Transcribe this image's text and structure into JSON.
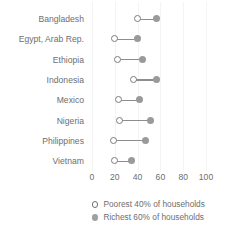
{
  "chart_data": {
    "type": "scatter",
    "subtype": "dumbbell",
    "title": "",
    "xlabel": "",
    "ylabel": "",
    "xlim": [
      0,
      100
    ],
    "xticks": [
      0,
      20,
      40,
      60,
      80,
      100
    ],
    "xtick_labels": [
      "0",
      "20",
      "40",
      "60",
      "80",
      "100"
    ],
    "grid": true,
    "legend_position": "bottom",
    "categories": [
      "Bangladesh",
      "Egypt, Arab Rep.",
      "Ethiopia",
      "Indonesia",
      "Mexico",
      "Nigeria",
      "Philippines",
      "Vietnam"
    ],
    "series": [
      {
        "name": "Poorest 40% of households",
        "marker": "open-circle",
        "color": "#7c7c7c",
        "values": [
          40,
          20,
          22,
          36,
          23,
          24,
          19,
          20
        ]
      },
      {
        "name": "Richest 60% of households",
        "marker": "filled-circle",
        "color": "#9a9a9a",
        "values": [
          57,
          40,
          44,
          57,
          42,
          51,
          47,
          35
        ]
      }
    ]
  },
  "legend": {
    "items": [
      {
        "label": "Poorest 40% of households",
        "marker": "open-circle"
      },
      {
        "label": "Richest 60% of households",
        "marker": "filled-circle"
      }
    ]
  },
  "colors": {
    "background": "#ffffff",
    "text": "#6e6e6e",
    "open_marker": "#7c7c7c",
    "filled_marker": "#9a9a9a",
    "connector": "#8e8e8e",
    "gridline": "#f4f4f4"
  }
}
